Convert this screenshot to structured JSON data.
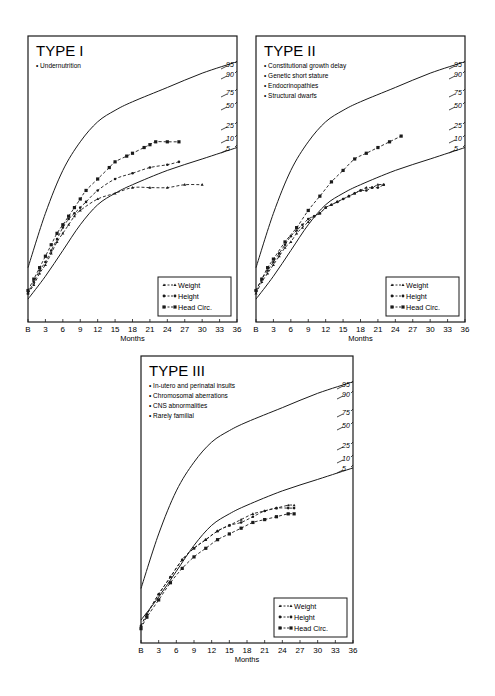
{
  "chart_data": [
    {
      "type": "line",
      "title": "TYPE I",
      "bullets": [
        "Undernutrition"
      ],
      "xlabel": "Months",
      "ylabel": "",
      "x_ticks": [
        "B",
        "3",
        "6",
        "9",
        "12",
        "15",
        "18",
        "21",
        "24",
        "27",
        "30",
        "33",
        "36"
      ],
      "xlim": [
        0,
        36
      ],
      "ylim": [
        0,
        100
      ],
      "percentile_labels": [
        "95",
        "90",
        "75",
        "50",
        "25",
        "10",
        "5"
      ],
      "reference_curves": [
        {
          "name": "95th percentile",
          "points": [
            [
              0,
              19
            ],
            [
              3,
              38
            ],
            [
              6,
              53
            ],
            [
              9,
              63
            ],
            [
              12,
              70
            ],
            [
              15,
              74
            ],
            [
              18,
              77
            ],
            [
              24,
              82
            ],
            [
              30,
              87
            ],
            [
              36,
              91
            ]
          ]
        },
        {
          "name": "5th percentile",
          "points": [
            [
              0,
              8
            ],
            [
              3,
              16
            ],
            [
              6,
              25
            ],
            [
              9,
              34
            ],
            [
              12,
              41
            ],
            [
              15,
              45
            ],
            [
              18,
              48
            ],
            [
              24,
              53
            ],
            [
              30,
              57
            ],
            [
              36,
              61
            ]
          ]
        }
      ],
      "legend": [
        "Weight",
        "Height",
        "Head Circ."
      ],
      "series": [
        {
          "name": "Weight",
          "marker": "triangle",
          "points": [
            [
              0,
              10
            ],
            [
              1,
              13
            ],
            [
              2,
              17
            ],
            [
              3,
              20
            ],
            [
              4,
              24
            ],
            [
              5,
              28
            ],
            [
              6,
              31
            ],
            [
              7,
              34
            ],
            [
              8,
              37
            ],
            [
              9,
              39
            ],
            [
              12,
              43
            ],
            [
              15,
              45
            ],
            [
              18,
              47
            ],
            [
              21,
              47
            ],
            [
              24,
              47
            ],
            [
              27,
              48
            ],
            [
              30,
              48
            ]
          ]
        },
        {
          "name": "Height",
          "marker": "circle",
          "points": [
            [
              0,
              10
            ],
            [
              1,
              14
            ],
            [
              2,
              18
            ],
            [
              3,
              21
            ],
            [
              4,
              25
            ],
            [
              5,
              29
            ],
            [
              6,
              33
            ],
            [
              7,
              36
            ],
            [
              8,
              38
            ],
            [
              9,
              40
            ],
            [
              10,
              42
            ],
            [
              12,
              46
            ],
            [
              15,
              50
            ],
            [
              18,
              52
            ],
            [
              21,
              54
            ],
            [
              24,
              55
            ],
            [
              26,
              56
            ]
          ]
        },
        {
          "name": "Head Circ.",
          "marker": "square",
          "points": [
            [
              0,
              11
            ],
            [
              1,
              15
            ],
            [
              2,
              19
            ],
            [
              3,
              23
            ],
            [
              4,
              27
            ],
            [
              5,
              31
            ],
            [
              6,
              34
            ],
            [
              7,
              37
            ],
            [
              8,
              40
            ],
            [
              9,
              43
            ],
            [
              10,
              46
            ],
            [
              12,
              50
            ],
            [
              14,
              54
            ],
            [
              15,
              56
            ],
            [
              17,
              58
            ],
            [
              18,
              59
            ],
            [
              20,
              61
            ],
            [
              21,
              62
            ],
            [
              22,
              63
            ],
            [
              24,
              63
            ],
            [
              26,
              63
            ]
          ]
        }
      ]
    },
    {
      "type": "line",
      "title": "TYPE II",
      "bullets": [
        "Constitutional growth delay",
        "Genetic short stature",
        "Endocrinopathies",
        "Structural dwarfs"
      ],
      "xlabel": "Months",
      "ylabel": "",
      "x_ticks": [
        "B",
        "3",
        "6",
        "9",
        "12",
        "15",
        "18",
        "21",
        "24",
        "27",
        "30",
        "33",
        "36"
      ],
      "xlim": [
        0,
        36
      ],
      "ylim": [
        0,
        100
      ],
      "percentile_labels": [
        "95",
        "90",
        "75",
        "50",
        "25",
        "10",
        "5"
      ],
      "reference_curves": [
        {
          "name": "95th percentile",
          "points": [
            [
              0,
              19
            ],
            [
              3,
              38
            ],
            [
              6,
              53
            ],
            [
              9,
              63
            ],
            [
              12,
              70
            ],
            [
              15,
              74
            ],
            [
              18,
              77
            ],
            [
              24,
              82
            ],
            [
              30,
              87
            ],
            [
              36,
              91
            ]
          ]
        },
        {
          "name": "5th percentile",
          "points": [
            [
              0,
              8
            ],
            [
              3,
              16
            ],
            [
              6,
              25
            ],
            [
              9,
              34
            ],
            [
              12,
              41
            ],
            [
              15,
              45
            ],
            [
              18,
              48
            ],
            [
              24,
              53
            ],
            [
              30,
              57
            ],
            [
              36,
              61
            ]
          ]
        }
      ],
      "legend": [
        "Weight",
        "Height",
        "Head Circ."
      ],
      "series": [
        {
          "name": "Weight",
          "marker": "triangle",
          "points": [
            [
              0,
              10
            ],
            [
              1,
              14
            ],
            [
              2,
              17
            ],
            [
              3,
              20
            ],
            [
              4,
              23
            ],
            [
              5,
              26
            ],
            [
              6,
              28
            ],
            [
              7,
              31
            ],
            [
              8,
              33
            ],
            [
              9,
              35
            ],
            [
              10,
              37
            ],
            [
              11,
              38
            ],
            [
              12,
              40
            ],
            [
              13,
              41
            ],
            [
              14,
              42
            ],
            [
              15,
              43
            ],
            [
              16,
              44
            ],
            [
              17,
              45
            ],
            [
              18,
              46
            ],
            [
              19,
              47
            ],
            [
              20,
              47
            ],
            [
              21,
              48
            ],
            [
              22,
              48
            ]
          ]
        },
        {
          "name": "Height",
          "marker": "circle",
          "points": [
            [
              0,
              11
            ],
            [
              1,
              15
            ],
            [
              2,
              18
            ],
            [
              3,
              21
            ],
            [
              4,
              24
            ],
            [
              5,
              27
            ],
            [
              6,
              30
            ],
            [
              7,
              32
            ],
            [
              8,
              34
            ],
            [
              9,
              36
            ],
            [
              10,
              37
            ],
            [
              11,
              38
            ],
            [
              12,
              40
            ],
            [
              13,
              41
            ],
            [
              14,
              42
            ],
            [
              15,
              43
            ],
            [
              16,
              44
            ],
            [
              17,
              45
            ],
            [
              18,
              46
            ],
            [
              19,
              46
            ],
            [
              20,
              47
            ],
            [
              21,
              47
            ],
            [
              22,
              48
            ]
          ]
        },
        {
          "name": "Head Circ.",
          "marker": "square",
          "points": [
            [
              0,
              11
            ],
            [
              1,
              15
            ],
            [
              2,
              19
            ],
            [
              3,
              22
            ],
            [
              5,
              28
            ],
            [
              7,
              33
            ],
            [
              9,
              39
            ],
            [
              11,
              44
            ],
            [
              13,
              49
            ],
            [
              15,
              53
            ],
            [
              17,
              57
            ],
            [
              19,
              59
            ],
            [
              21,
              61
            ],
            [
              23,
              63
            ],
            [
              25,
              65
            ]
          ]
        }
      ]
    },
    {
      "type": "line",
      "title": "TYPE III",
      "bullets": [
        "In-utero and perinatal insults",
        "Chromosomal aberrations",
        "CNS abnormalities",
        "Rarely familial"
      ],
      "xlabel": "Months",
      "ylabel": "",
      "x_ticks": [
        "B",
        "3",
        "6",
        "9",
        "12",
        "15",
        "18",
        "21",
        "24",
        "27",
        "30",
        "33",
        "36"
      ],
      "xlim": [
        0,
        36
      ],
      "ylim": [
        0,
        100
      ],
      "percentile_labels": [
        "95",
        "90",
        "75",
        "50",
        "25",
        "10",
        "5"
      ],
      "reference_curves": [
        {
          "name": "95th percentile",
          "points": [
            [
              0,
              19
            ],
            [
              3,
              38
            ],
            [
              6,
              53
            ],
            [
              9,
              63
            ],
            [
              12,
              70
            ],
            [
              15,
              74
            ],
            [
              18,
              77
            ],
            [
              24,
              82
            ],
            [
              30,
              87
            ],
            [
              36,
              91
            ]
          ]
        },
        {
          "name": "5th percentile",
          "points": [
            [
              0,
              8
            ],
            [
              3,
              16
            ],
            [
              6,
              25
            ],
            [
              9,
              34
            ],
            [
              12,
              41
            ],
            [
              15,
              45
            ],
            [
              18,
              48
            ],
            [
              24,
              53
            ],
            [
              30,
              57
            ],
            [
              36,
              61
            ]
          ]
        }
      ],
      "legend": [
        "Weight",
        "Height",
        "Head Circ."
      ],
      "series": [
        {
          "name": "Weight",
          "marker": "triangle",
          "points": [
            [
              0,
              6
            ],
            [
              1,
              10
            ],
            [
              3,
              17
            ],
            [
              5,
              23
            ],
            [
              7,
              29
            ],
            [
              9,
              33
            ],
            [
              11,
              36
            ],
            [
              13,
              39
            ],
            [
              15,
              41
            ],
            [
              17,
              43
            ],
            [
              19,
              45
            ],
            [
              21,
              46
            ],
            [
              23,
              47
            ],
            [
              25,
              48
            ],
            [
              26,
              48
            ]
          ]
        },
        {
          "name": "Height",
          "marker": "circle",
          "points": [
            [
              0,
              6
            ],
            [
              1,
              10
            ],
            [
              3,
              17
            ],
            [
              5,
              23
            ],
            [
              7,
              29
            ],
            [
              9,
              33
            ],
            [
              11,
              36
            ],
            [
              13,
              39
            ],
            [
              15,
              41
            ],
            [
              17,
              42
            ],
            [
              19,
              44
            ],
            [
              21,
              46
            ],
            [
              23,
              47
            ],
            [
              25,
              47
            ],
            [
              26,
              47
            ]
          ]
        },
        {
          "name": "Head Circ.",
          "marker": "square",
          "points": [
            [
              0,
              5
            ],
            [
              1,
              9
            ],
            [
              3,
              15
            ],
            [
              5,
              21
            ],
            [
              7,
              26
            ],
            [
              9,
              30
            ],
            [
              11,
              33
            ],
            [
              13,
              36
            ],
            [
              15,
              38
            ],
            [
              17,
              40
            ],
            [
              19,
              42
            ],
            [
              21,
              43
            ],
            [
              23,
              44
            ],
            [
              25,
              45
            ],
            [
              26,
              45
            ]
          ]
        }
      ]
    }
  ]
}
